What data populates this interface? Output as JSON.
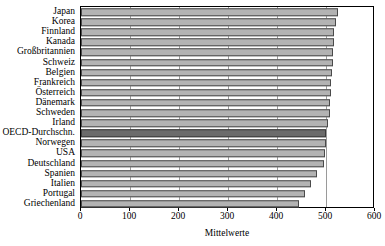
{
  "chart_data": {
    "type": "bar",
    "orientation": "horizontal",
    "title": "",
    "xlabel": "Mittelwerte",
    "ylabel": "",
    "xlim": [
      0,
      600
    ],
    "xticks": [
      0,
      100,
      200,
      300,
      400,
      500,
      600
    ],
    "xtick_labels": [
      "0",
      "100",
      "200",
      "300",
      "400",
      "500",
      "600"
    ],
    "grid": true,
    "grid_axis": "x",
    "legend": "none",
    "categories": [
      "Japan",
      "Korea",
      "Finnland",
      "Kanada",
      "Großbritannien",
      "Schweiz",
      "Belgien",
      "Frankreich",
      "Österreich",
      "Dänemark",
      "Schweden",
      "Irland",
      "OECD-Durchschn.",
      "Norwegen",
      "USA",
      "Deutschland",
      "Spanien",
      "Italien",
      "Portugal",
      "Griechenland"
    ],
    "values": [
      524,
      520,
      517,
      516,
      514,
      514,
      513,
      511,
      510,
      509,
      508,
      505,
      500,
      499,
      498,
      495,
      481,
      469,
      457,
      445
    ],
    "highlight_category": "OECD-Durchschn.",
    "colors": {
      "bar_fill": "#b3b3b3",
      "bar_edge": "#4a4a4a",
      "highlight_fill": "#6b6b6b",
      "highlight_edge": "#3a3a3a",
      "grid": "#9a9a9a",
      "axis": "#000000",
      "background": "#ffffff",
      "text": "#000000"
    }
  }
}
